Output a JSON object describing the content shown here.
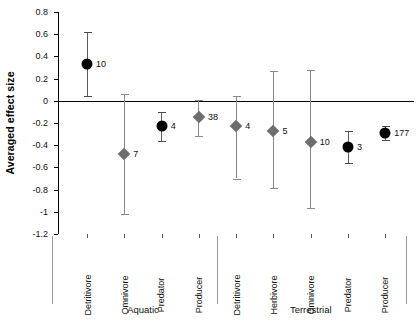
{
  "chart_data": {
    "type": "scatter",
    "title": "",
    "xlabel": "",
    "ylabel": "Averaged effect size",
    "ylim": [
      -1.2,
      0.8
    ],
    "ytick_step": 0.2,
    "ytick_labels": [
      "0.8",
      "0.6",
      "0.4",
      "0.2",
      "0",
      "-0.2",
      "-0.4",
      "-0.6",
      "-0.8",
      "-1",
      "-1.2"
    ],
    "ytick_values": [
      0.8,
      0.6,
      0.4,
      0.2,
      0,
      -0.2,
      -0.4,
      -0.6,
      -0.8,
      -1.0,
      -1.2
    ],
    "grid": false,
    "legend": "none",
    "zero_reference_line": 0,
    "marker_styles": {
      "circle": {
        "shape": "circle",
        "color": "#000000",
        "meaning": "animal-consumer"
      },
      "diamond": {
        "shape": "diamond",
        "color": "#6e6e6e",
        "meaning": "other"
      }
    },
    "groups": [
      {
        "name": "Aquatic",
        "categories": [
          "Detritivore",
          "Omnivore",
          "Predator",
          "Producer"
        ]
      },
      {
        "name": "Terrestrial",
        "categories": [
          "Detritivore",
          "Herbivore",
          "Omnivore",
          "Predator",
          "Producer"
        ]
      }
    ],
    "points": [
      {
        "group": "Aquatic",
        "category": "Detritivore",
        "value": 0.33,
        "ci_low": 0.04,
        "ci_high": 0.62,
        "n": "10",
        "marker": "circle"
      },
      {
        "group": "Aquatic",
        "category": "Omnivore",
        "value": -0.48,
        "ci_low": -1.02,
        "ci_high": 0.06,
        "n": "7",
        "marker": "diamond"
      },
      {
        "group": "Aquatic",
        "category": "Predator",
        "value": -0.23,
        "ci_low": -0.36,
        "ci_high": -0.1,
        "n": "4",
        "marker": "circle"
      },
      {
        "group": "Aquatic",
        "category": "Producer",
        "value": -0.15,
        "ci_low": -0.32,
        "ci_high": 0.01,
        "n": "38",
        "marker": "diamond"
      },
      {
        "group": "Terrestrial",
        "category": "Detritivore",
        "value": -0.23,
        "ci_low": -0.7,
        "ci_high": 0.04,
        "n": "4",
        "marker": "diamond"
      },
      {
        "group": "Terrestrial",
        "category": "Herbivore",
        "value": -0.27,
        "ci_low": -0.79,
        "ci_high": 0.27,
        "n": "5",
        "marker": "diamond"
      },
      {
        "group": "Terrestrial",
        "category": "Omnivore",
        "value": -0.37,
        "ci_low": -0.97,
        "ci_high": 0.28,
        "n": "10",
        "marker": "diamond"
      },
      {
        "group": "Terrestrial",
        "category": "Predator",
        "value": -0.42,
        "ci_low": -0.56,
        "ci_high": -0.27,
        "n": "3",
        "marker": "circle"
      },
      {
        "group": "Terrestrial",
        "category": "Producer",
        "value": -0.29,
        "ci_low": -0.35,
        "ci_high": -0.23,
        "n": "177",
        "marker": "circle"
      }
    ]
  }
}
